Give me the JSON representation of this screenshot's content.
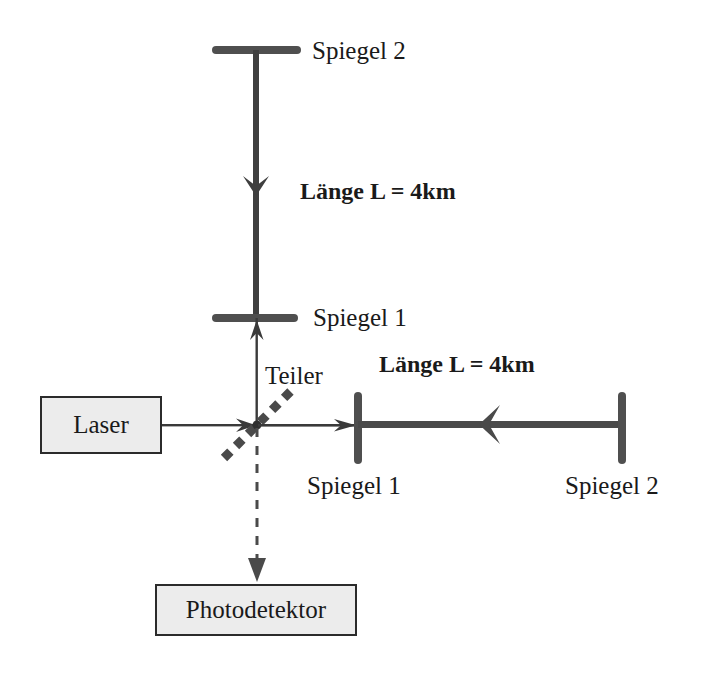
{
  "figure": {
    "type": "optical-schematic",
    "language": "de"
  },
  "colors": {
    "beam_thick": "#4a4a4a",
    "beam_thin": "#3a3a3a",
    "mirror": "#5a5a5a",
    "box_fill": "#ececec",
    "box_border": "#2b2b2b",
    "text": "#1a1a1a",
    "splitter": "#4a4a4a",
    "background": "#ffffff"
  },
  "labels": {
    "spiegel2_top": "Spiegel 2",
    "laenge_vertical": "Länge L  =  4km",
    "spiegel1_vertical": "Spiegel 1",
    "teiler": "Teiler",
    "laenge_horizontal": "Länge L  =  4km",
    "spiegel1_bottom": "Spiegel 1",
    "spiegel2_bottom": "Spiegel 2"
  },
  "boxes": {
    "laser": "Laser",
    "photodetektor": "Photodetektor"
  },
  "components": {
    "vertical_arm": {
      "mirror_far": "Spiegel 2",
      "mirror_near": "Spiegel 1",
      "arm_length": "4km",
      "beam_direction": "down"
    },
    "horizontal_arm": {
      "mirror_near": "Spiegel 1",
      "mirror_far": "Spiegel 2",
      "arm_length": "4km",
      "beam_direction": "left"
    },
    "beam_splitter": {
      "name": "Teiler",
      "style": "dotted-diagonal",
      "angle_deg": 45
    },
    "source": "Laser",
    "detector": "Photodetektor",
    "output_beam_style": "dashed"
  }
}
